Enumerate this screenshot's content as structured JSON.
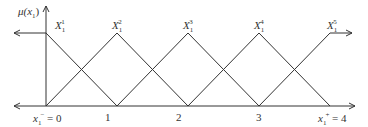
{
  "diagram": {
    "y_axis_label": "μ(x₁)",
    "y_axis_label_parts": {
      "base": "μ(x",
      "sub": "1",
      "close": ")"
    },
    "sets": [
      {
        "name": "X",
        "sub": "1",
        "sup": "1",
        "peak": 0
      },
      {
        "name": "X",
        "sub": "1",
        "sup": "2",
        "peak": 1
      },
      {
        "name": "X",
        "sub": "1",
        "sup": "3",
        "peak": 2
      },
      {
        "name": "X",
        "sub": "1",
        "sup": "4",
        "peak": 3
      },
      {
        "name": "X",
        "sub": "1",
        "sup": "5",
        "peak": 4
      }
    ],
    "x_ticks": [
      {
        "value": "0",
        "label": "x₁⁻ = 0",
        "parts": {
          "var": "x",
          "sub": "1",
          "sup": "−",
          "eq": " = 0"
        }
      },
      {
        "value": "1",
        "label": "1"
      },
      {
        "value": "2",
        "label": "2"
      },
      {
        "value": "3",
        "label": "3"
      },
      {
        "value": "4",
        "label": "x₁⁺ = 4",
        "parts": {
          "var": "x",
          "sub": "1",
          "sup": "+",
          "eq": " = 4"
        }
      }
    ],
    "colors": {
      "line": "#333333",
      "background": "#ffffff"
    }
  }
}
